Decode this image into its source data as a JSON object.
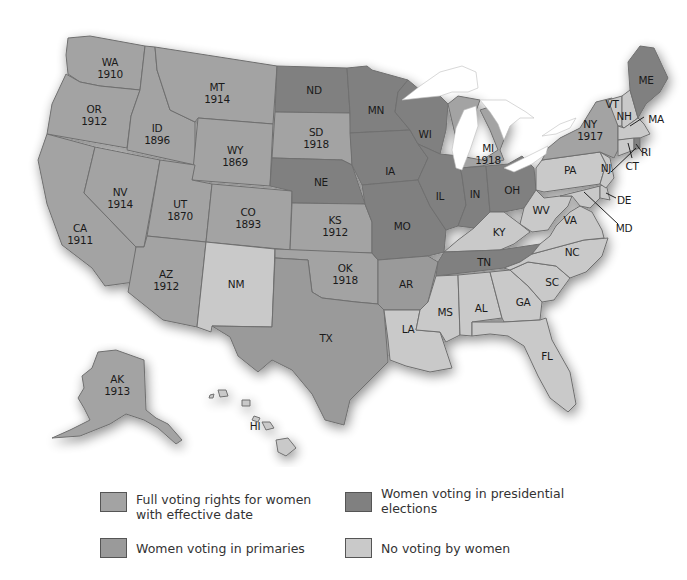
{
  "colors": {
    "full": "#a3a3a3",
    "primaries": "#9a9a9a",
    "presidential": "#808080",
    "none": "#c9c9c9",
    "border": "#6f6f6f",
    "lakes": "#ffffff"
  },
  "states": {
    "WA": {
      "label": "WA",
      "year": "1910",
      "category": "full"
    },
    "OR": {
      "label": "OR",
      "year": "1912",
      "category": "full"
    },
    "CA": {
      "label": "CA",
      "year": "1911",
      "category": "full"
    },
    "ID": {
      "label": "ID",
      "year": "1896",
      "category": "full"
    },
    "NV": {
      "label": "NV",
      "year": "1914",
      "category": "full"
    },
    "MT": {
      "label": "MT",
      "year": "1914",
      "category": "full"
    },
    "WY": {
      "label": "WY",
      "year": "1869",
      "category": "full"
    },
    "UT": {
      "label": "UT",
      "year": "1870",
      "category": "full"
    },
    "CO": {
      "label": "CO",
      "year": "1893",
      "category": "full"
    },
    "AZ": {
      "label": "AZ",
      "year": "1912",
      "category": "full"
    },
    "NM": {
      "label": "NM",
      "year": "",
      "category": "none"
    },
    "ND": {
      "label": "ND",
      "year": "",
      "category": "presidential"
    },
    "SD": {
      "label": "SD",
      "year": "1918",
      "category": "full"
    },
    "NE": {
      "label": "NE",
      "year": "",
      "category": "presidential"
    },
    "KS": {
      "label": "KS",
      "year": "1912",
      "category": "full"
    },
    "OK": {
      "label": "OK",
      "year": "1918",
      "category": "full"
    },
    "TX": {
      "label": "TX",
      "year": "",
      "category": "primaries"
    },
    "MN": {
      "label": "MN",
      "year": "",
      "category": "presidential"
    },
    "IA": {
      "label": "IA",
      "year": "",
      "category": "presidential"
    },
    "MO": {
      "label": "MO",
      "year": "",
      "category": "presidential"
    },
    "AR": {
      "label": "AR",
      "year": "",
      "category": "primaries"
    },
    "LA": {
      "label": "LA",
      "year": "",
      "category": "none"
    },
    "WI": {
      "label": "WI",
      "year": "",
      "category": "presidential"
    },
    "IL": {
      "label": "IL",
      "year": "",
      "category": "presidential"
    },
    "MI": {
      "label": "MI",
      "year": "1918",
      "category": "full"
    },
    "IN": {
      "label": "IN",
      "year": "",
      "category": "presidential"
    },
    "OH": {
      "label": "OH",
      "year": "",
      "category": "presidential"
    },
    "KY": {
      "label": "KY",
      "year": "",
      "category": "none"
    },
    "TN": {
      "label": "TN",
      "year": "",
      "category": "presidential"
    },
    "MS": {
      "label": "MS",
      "year": "",
      "category": "none"
    },
    "AL": {
      "label": "AL",
      "year": "",
      "category": "none"
    },
    "GA": {
      "label": "GA",
      "year": "",
      "category": "none"
    },
    "FL": {
      "label": "FL",
      "year": "",
      "category": "none"
    },
    "SC": {
      "label": "SC",
      "year": "",
      "category": "none"
    },
    "NC": {
      "label": "NC",
      "year": "",
      "category": "none"
    },
    "VA": {
      "label": "VA",
      "year": "",
      "category": "none"
    },
    "WV": {
      "label": "WV",
      "year": "",
      "category": "none"
    },
    "PA": {
      "label": "PA",
      "year": "",
      "category": "none"
    },
    "NY": {
      "label": "NY",
      "year": "1917",
      "category": "full"
    },
    "VT": {
      "label": "VT",
      "year": "",
      "category": "none"
    },
    "NH": {
      "label": "NH",
      "year": "",
      "category": "none"
    },
    "ME": {
      "label": "ME",
      "year": "",
      "category": "presidential"
    },
    "MA": {
      "label": "MA",
      "year": "",
      "category": "none"
    },
    "RI": {
      "label": "RI",
      "year": "",
      "category": "presidential"
    },
    "CT": {
      "label": "CT",
      "year": "",
      "category": "none"
    },
    "NJ": {
      "label": "NJ",
      "year": "",
      "category": "none"
    },
    "DE": {
      "label": "DE",
      "year": "",
      "category": "none"
    },
    "MD": {
      "label": "MD",
      "year": "",
      "category": "none"
    },
    "AK": {
      "label": "AK",
      "year": "1913",
      "category": "full"
    },
    "HI": {
      "label": "HI",
      "year": "",
      "category": "none"
    }
  },
  "legend": {
    "items": [
      {
        "key": "full",
        "line1": "Full voting rights for women",
        "line2": "with effective date"
      },
      {
        "key": "presidential",
        "line1": "Women voting in presidential",
        "line2": "elections"
      },
      {
        "key": "primaries",
        "line1": "Women voting in primaries",
        "line2": ""
      },
      {
        "key": "none",
        "line1": "No voting by women",
        "line2": ""
      }
    ]
  }
}
